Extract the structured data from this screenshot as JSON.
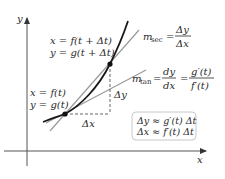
{
  "diagram": {
    "axes": {
      "x_label": "x",
      "y_label": "y"
    },
    "points": {
      "upper": {
        "label_line1": "x = f(t + Δt)",
        "label_line2": "y = g(t + Δt)"
      },
      "lower": {
        "label_line1": "x = f(t)",
        "label_line2": "y = g(t)"
      }
    },
    "increments": {
      "dx_label": "Δx",
      "dy_label": "Δy"
    },
    "secant": {
      "m_label": "m",
      "m_sub": "sec",
      "equals": "=",
      "numerator": "Δy",
      "denominator": "Δx"
    },
    "tangent": {
      "m_label": "m",
      "m_sub": "tan",
      "equals1": "=",
      "numerator1": "dy",
      "denominator1": "dx",
      "equals2": "=",
      "numerator2": "g′(t)",
      "denominator2": "f′(t)"
    },
    "approx_box": {
      "line1": "Δy ≈ g′(t) Δt",
      "line2": "Δx ≈ f′(t) Δt"
    },
    "colors": {
      "curve": "#1a1a1a",
      "lines": "#9a9a9a",
      "axes": "#555555",
      "dashed": "#666666",
      "box_border": "#c8c8c8"
    }
  }
}
